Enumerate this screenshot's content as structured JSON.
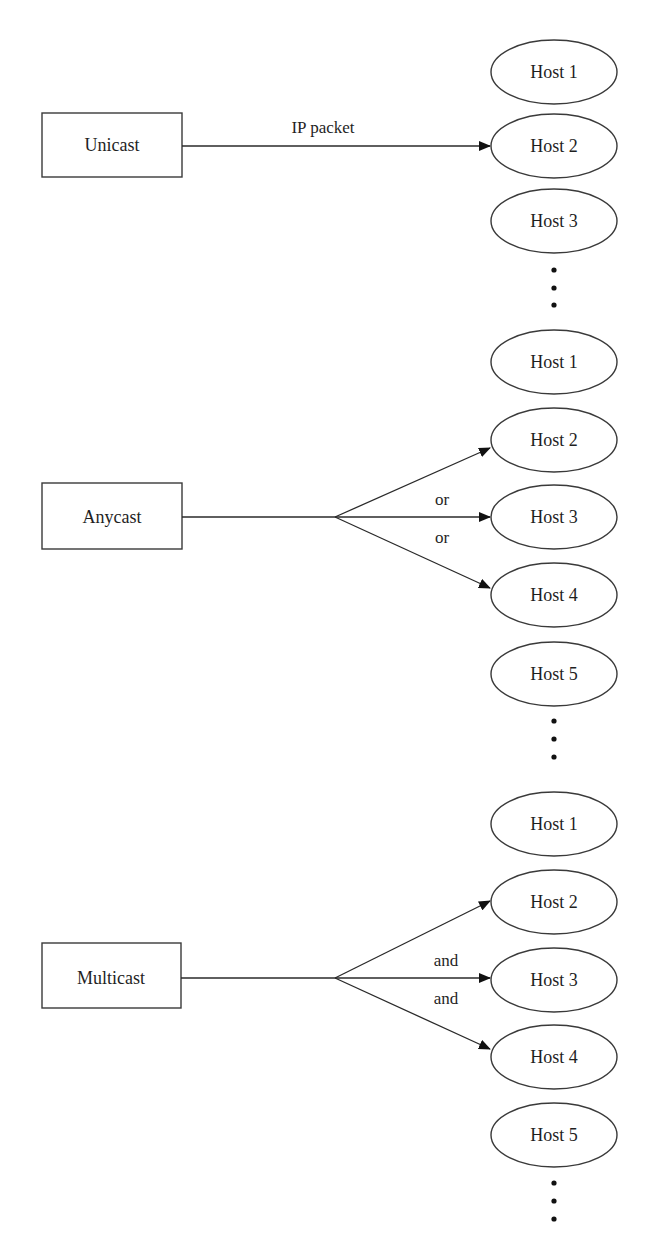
{
  "figure": {
    "sections": [
      {
        "id": "unicast",
        "source_label": "Unicast",
        "edge_label": "IP packet",
        "branch_labels": [],
        "hosts": [
          "Host 1",
          "Host 2",
          "Host 3"
        ],
        "targets": [
          "Host 2"
        ],
        "continues": true
      },
      {
        "id": "anycast",
        "source_label": "Anycast",
        "edge_label": "",
        "branch_labels": [
          "or",
          "or"
        ],
        "hosts": [
          "Host 1",
          "Host 2",
          "Host 3",
          "Host 4",
          "Host 5"
        ],
        "targets": [
          "Host 2",
          "Host 3",
          "Host 4"
        ],
        "continues": true
      },
      {
        "id": "multicast",
        "source_label": "Multicast",
        "edge_label": "",
        "branch_labels": [
          "and",
          "and"
        ],
        "hosts": [
          "Host 1",
          "Host 2",
          "Host 3",
          "Host 4",
          "Host 5"
        ],
        "targets": [
          "Host 2",
          "Host 3",
          "Host 4"
        ],
        "continues": true
      }
    ],
    "colors": {
      "stroke": "#3a3a3a",
      "text": "#1f1f1f",
      "background": "#ffffff"
    }
  }
}
